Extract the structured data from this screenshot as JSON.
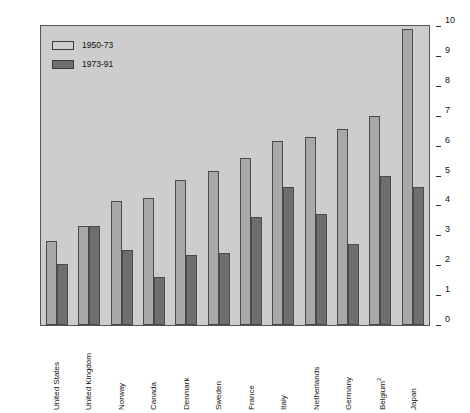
{
  "chart_data": {
    "type": "bar",
    "title": "",
    "xlabel": "",
    "ylabel": "",
    "ylim": [
      0,
      10
    ],
    "yticks": [
      0,
      1,
      2,
      3,
      4,
      5,
      6,
      7,
      8,
      9,
      10
    ],
    "grid": false,
    "legend_position": "top-left",
    "categories": [
      "United States",
      "United Kingdom",
      "Norway",
      "Canada",
      "Denmark",
      "Sweden",
      "France",
      "Italy",
      "Netherlands",
      "Germany",
      "Belgium",
      "Japan"
    ],
    "category_labels": [
      "United States",
      "United Kingdom",
      "Norway",
      "Canada",
      "Denmark",
      "Sweden",
      "France",
      "Italy",
      "Netherlands",
      "Germany",
      "Belgium²",
      "Japan"
    ],
    "series": [
      {
        "name": "1950-73",
        "color": "#a8a8a8",
        "values": [
          2.8,
          3.3,
          4.15,
          4.25,
          4.85,
          5.15,
          5.6,
          6.15,
          6.3,
          6.55,
          7.0,
          9.9
        ]
      },
      {
        "name": "1973-91",
        "color": "#6e6e6e",
        "values": [
          2.05,
          3.3,
          2.5,
          1.6,
          2.35,
          2.4,
          3.6,
          4.6,
          3.7,
          2.7,
          5.0,
          4.6
        ]
      }
    ]
  },
  "axes": {
    "left_ticks": [
      "0",
      "1",
      "2",
      "3",
      "4",
      "5",
      "6",
      "7",
      "8",
      "9",
      "10"
    ],
    "right_ticks": [
      "0",
      "1",
      "2",
      "3",
      "4",
      "5",
      "6",
      "7",
      "8",
      "9",
      "10"
    ]
  },
  "legend": {
    "entries": [
      {
        "label": "1950-73",
        "swatch": "light-gray-swatch"
      },
      {
        "label": "1973-91",
        "swatch": "dark-gray-swatch"
      }
    ]
  },
  "colors": {
    "plot_background": "#cdcdcd",
    "page_background": "#ffffff",
    "series_light": "#a8a8a8",
    "series_dark": "#6e6e6e",
    "axis_line": "#555555",
    "text": "#111111"
  }
}
